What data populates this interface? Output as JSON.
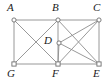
{
  "figure": {
    "background_color": "#ffffff",
    "width": 110,
    "height": 84,
    "edge_color": "#8d8d8d",
    "vertex_fill_color": "#ffffff",
    "vertex_stroke_color": "#6e6e6e",
    "label_color": "#1a1a1a"
  },
  "vertices": [
    {
      "id": "A",
      "label": "A",
      "x": 14,
      "y": 20,
      "label_x": 7,
      "label_y": 2,
      "shape": "circle"
    },
    {
      "id": "B",
      "label": "B",
      "x": 58,
      "y": 20,
      "label_x": 52,
      "label_y": 2,
      "shape": "circle"
    },
    {
      "id": "C",
      "label": "C",
      "x": 99,
      "y": 20,
      "label_x": 93,
      "label_y": 2,
      "shape": "circle"
    },
    {
      "id": "D",
      "label": "D",
      "x": 59,
      "y": 43,
      "label_x": 44,
      "label_y": 35,
      "shape": "circle"
    },
    {
      "id": "G",
      "label": "G",
      "x": 14,
      "y": 64,
      "label_x": 7,
      "label_y": 68,
      "shape": "square"
    },
    {
      "id": "F",
      "label": "F",
      "x": 58,
      "y": 64,
      "label_x": 52,
      "label_y": 68,
      "shape": "square"
    },
    {
      "id": "E",
      "label": "E",
      "x": 99,
      "y": 64,
      "label_x": 93,
      "label_y": 68,
      "shape": "square"
    }
  ],
  "edges": [
    {
      "from": "A",
      "to": "B",
      "kind": "outer-top-left"
    },
    {
      "from": "B",
      "to": "C",
      "kind": "outer-top-right"
    },
    {
      "from": "A",
      "to": "G",
      "kind": "outer-left"
    },
    {
      "from": "C",
      "to": "E",
      "kind": "outer-right"
    },
    {
      "from": "G",
      "to": "F",
      "kind": "outer-bottom-left"
    },
    {
      "from": "F",
      "to": "E",
      "kind": "outer-bottom-right"
    },
    {
      "from": "B",
      "to": "F",
      "kind": "vertical-middle"
    },
    {
      "from": "A",
      "to": "F",
      "kind": "diagonal"
    },
    {
      "from": "B",
      "to": "G",
      "kind": "diagonal"
    },
    {
      "from": "B",
      "to": "E",
      "kind": "diagonal"
    },
    {
      "from": "C",
      "to": "F",
      "kind": "diagonal"
    },
    {
      "from": "D",
      "to": "C",
      "kind": "spoke"
    },
    {
      "from": "D",
      "to": "E",
      "kind": "spoke"
    },
    {
      "from": "D",
      "to": "F",
      "kind": "spoke"
    }
  ]
}
